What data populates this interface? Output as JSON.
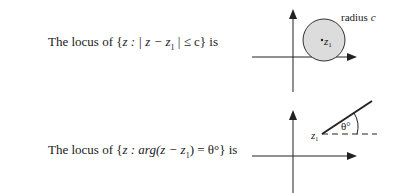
{
  "row1": {
    "prefix": "The locus of {",
    "expr": "z : | z − z",
    "sub": "1",
    "suffix": " | ≤ c} is",
    "diagram": {
      "label_radius": "radius ",
      "label_radius_var": "c",
      "center_label": "z",
      "center_sub": "1",
      "fill_color": "#dcdcdc"
    }
  },
  "row2": {
    "prefix": "The locus of {",
    "expr": "z : arg(z − z",
    "sub": "1",
    "suffix": ") = θ°} is",
    "diagram": {
      "point_label": "z",
      "point_sub": "1",
      "angle_label": "θ°"
    }
  }
}
